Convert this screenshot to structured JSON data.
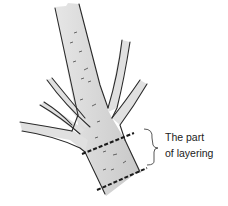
{
  "figure": {
    "annotation": {
      "line1": "The part",
      "line2": "of layering"
    },
    "colors": {
      "bark_fill": "#d9d9d9",
      "outline": "#2a2a2a",
      "dash": "#1a1a1a",
      "text": "#222222"
    }
  }
}
